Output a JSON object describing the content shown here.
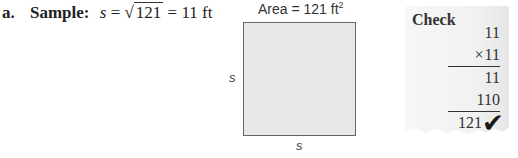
{
  "sample": {
    "part_label": "a.",
    "title": "Sample:",
    "variable": "s",
    "equals1": "=",
    "radical": "√",
    "radicand": "121",
    "equals2": "=",
    "result": "11 ft"
  },
  "figure": {
    "area_label": "Area = 121 ft",
    "area_exponent": "2",
    "side_left": "s",
    "side_bottom": "s",
    "fill_color": "#e8e8e8",
    "border_color": "#666666"
  },
  "check": {
    "title": "Check",
    "rows": [
      {
        "text": "11",
        "ruled": false
      },
      {
        "prefix": "×",
        "text": "11",
        "ruled": true
      },
      {
        "text": "11",
        "ruled": false
      },
      {
        "text": "110",
        "ruled": true
      },
      {
        "text": "121",
        "ruled": false
      }
    ],
    "checkmark": "✔"
  }
}
